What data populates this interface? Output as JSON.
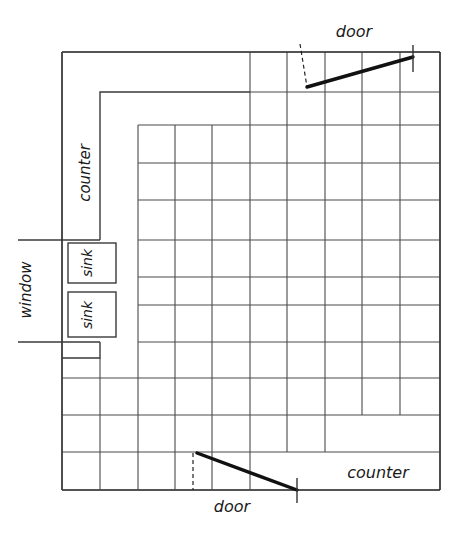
{
  "drawing": {
    "title": "kitchen-floor-plan-sketch",
    "background_color": "#ffffff",
    "line_color": "#4a4a4a",
    "wall_color": "#3a3a3a",
    "door_color": "#111111",
    "text_color": "#1a1a1a"
  },
  "labels": {
    "door_top": "door",
    "door_bottom": "door",
    "counter_left": "counter",
    "counter_bottom_right": "counter",
    "window_left": "window",
    "sink_upper": "sink",
    "sink_lower": "sink"
  },
  "geometry": {
    "room": {
      "x1": 62,
      "y1": 52,
      "x2": 440,
      "y2": 490
    },
    "tile_grid": {
      "x_lines": [
        62,
        100,
        138,
        175,
        212,
        250,
        287,
        325,
        362,
        400,
        440
      ],
      "y_lines": [
        52,
        92,
        125,
        163,
        200,
        240,
        277,
        305,
        342,
        378,
        415,
        452,
        490
      ],
      "columns": 10,
      "rows": 12
    },
    "counter_left_outline": [
      {
        "x": 100,
        "y": 92
      },
      {
        "x": 100,
        "y": 240
      }
    ],
    "counter_left_top_run": [
      {
        "x": 100,
        "y": 92
      },
      {
        "x": 250,
        "y": 92
      }
    ],
    "counter_lower_jog": [
      {
        "x": 100,
        "y": 342
      },
      {
        "x": 100,
        "y": 358
      },
      {
        "x": 62,
        "y": 358
      }
    ],
    "window_ticks": [
      {
        "x1": 18,
        "y1": 240,
        "x2": 100,
        "y2": 240
      },
      {
        "x1": 18,
        "y1": 342,
        "x2": 100,
        "y2": 342
      }
    ],
    "sinks": [
      {
        "x": 68,
        "y": 243,
        "w": 48,
        "h": 40
      },
      {
        "x": 68,
        "y": 292,
        "w": 48,
        "h": 45
      }
    ],
    "door_top": {
      "hinge": {
        "x": 307,
        "y": 87
      },
      "leaf_end": {
        "x": 413,
        "y": 57
      },
      "dash_from": {
        "x": 300,
        "y": 44
      },
      "dash_to": {
        "x": 307,
        "y": 87
      },
      "tick_x": 413,
      "tick_y1": 45,
      "tick_y2": 72
    },
    "door_bottom": {
      "hinge": {
        "x": 197,
        "y": 453
      },
      "leaf_end": {
        "x": 297,
        "y": 490
      },
      "dash_from": {
        "x": 193,
        "y": 453
      },
      "dash_to": {
        "x": 193,
        "y": 490
      },
      "tick_x": 297,
      "tick_y1": 478,
      "tick_y2": 503
    },
    "label_positions": {
      "door_top": {
        "x": 354,
        "y": 37
      },
      "door_bottom": {
        "x": 232,
        "y": 512
      },
      "counter_left": {
        "x": 90,
        "y": 173,
        "rotate": -90
      },
      "counter_bottom_right": {
        "x": 378,
        "y": 478
      },
      "window_left": {
        "x": 31,
        "y": 290,
        "rotate": -90
      },
      "sink_upper": {
        "x": 92,
        "y": 263,
        "rotate": -90
      },
      "sink_lower": {
        "x": 92,
        "y": 315,
        "rotate": -90
      }
    }
  }
}
